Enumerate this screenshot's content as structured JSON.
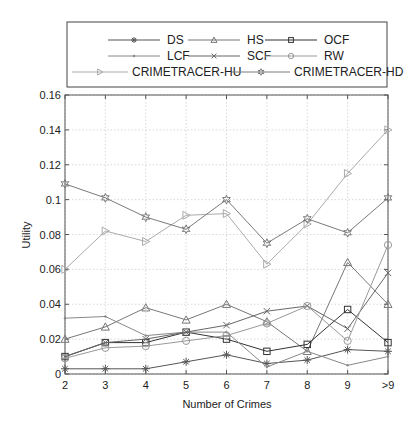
{
  "chart_data": {
    "type": "line",
    "title": "",
    "xlabel": "Number of Crimes",
    "ylabel": "Utility",
    "categories": [
      "2",
      "3",
      "4",
      "5",
      "6",
      "7",
      "8",
      "9",
      ">9"
    ],
    "ylim": [
      0,
      0.16
    ],
    "yticks": [
      0,
      0.02,
      0.04,
      0.06,
      0.08,
      0.1,
      0.12,
      0.14,
      0.16
    ],
    "ytick_labels": [
      "0",
      "0.02",
      "0.04",
      "0.06",
      "0.08",
      "0.1",
      "0.12",
      "0.14",
      "0.16"
    ],
    "grid": true,
    "legend_position": "top-outside",
    "series": [
      {
        "name": "DS",
        "marker": "asterisk",
        "color": "#555555",
        "values": [
          0.003,
          0.003,
          0.003,
          0.007,
          0.011,
          0.006,
          0.008,
          0.014,
          0.013
        ]
      },
      {
        "name": "HS",
        "marker": "triangle-up",
        "color": "#777777",
        "values": [
          0.02,
          0.027,
          0.038,
          0.031,
          0.04,
          0.03,
          0.013,
          0.064,
          0.04
        ]
      },
      {
        "name": "OCF",
        "marker": "square",
        "color": "#333333",
        "values": [
          0.01,
          0.018,
          0.018,
          0.024,
          0.02,
          0.013,
          0.017,
          0.037,
          0.018
        ]
      },
      {
        "name": "LCF",
        "marker": "point",
        "color": "#888888",
        "values": [
          0.032,
          0.033,
          0.022,
          0.024,
          0.024,
          0.004,
          0.013,
          0.005,
          0.01
        ]
      },
      {
        "name": "SCF",
        "marker": "x",
        "color": "#666666",
        "values": [
          0.01,
          0.018,
          0.02,
          0.024,
          0.028,
          0.036,
          0.039,
          0.026,
          0.058
        ]
      },
      {
        "name": "RW",
        "marker": "circle",
        "color": "#999999",
        "values": [
          0.009,
          0.015,
          0.016,
          0.019,
          0.022,
          0.029,
          0.039,
          0.019,
          0.074
        ]
      },
      {
        "name": "CRIMETRACER-HU",
        "marker": "triangle-right",
        "color": "#aaaaaa",
        "values": [
          0.06,
          0.082,
          0.076,
          0.091,
          0.092,
          0.063,
          0.086,
          0.115,
          0.14
        ]
      },
      {
        "name": "CRIMETRACER-HD",
        "marker": "hexagram",
        "color": "#7a7a7a",
        "values": [
          0.109,
          0.101,
          0.09,
          0.083,
          0.1,
          0.075,
          0.089,
          0.081,
          0.101
        ]
      }
    ]
  }
}
